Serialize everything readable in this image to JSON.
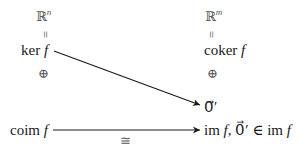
{
  "diagram": {
    "left_column": {
      "top_space": {
        "base": "ℝ",
        "exp": "n"
      },
      "equals": "=",
      "kernel": {
        "op": "ker",
        "fn": "f"
      },
      "direct_sum": "⊕",
      "coimage": {
        "op": "coim",
        "fn": "f"
      }
    },
    "right_column": {
      "top_space": {
        "base": "ℝ",
        "exp": "m"
      },
      "equals": "=",
      "cokernel": {
        "op": "coker",
        "fn": "f"
      },
      "direct_sum": "⊕",
      "zero_vector": "0⃗′",
      "image": {
        "op": "im",
        "fn": "f",
        "rest": ", 0⃗′ ∈ im "
      }
    },
    "arrows": [
      {
        "from": "ker f",
        "to": "0⃗′",
        "label": ""
      },
      {
        "from": "coim f",
        "to": "im f",
        "label": "≅"
      }
    ]
  }
}
